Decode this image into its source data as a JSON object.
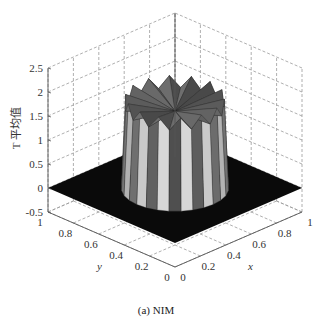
{
  "chart_data": {
    "type": "surface3d",
    "title": "",
    "caption": "(a) NIM",
    "xlabel": "x",
    "ylabel": "y",
    "zlabel": "T 平均值",
    "xlim": [
      0,
      1
    ],
    "ylim": [
      0,
      1
    ],
    "zlim": [
      -0.5,
      2.5
    ],
    "xticks": [
      "0",
      "0.2",
      "0.4",
      "0.6",
      "0.8",
      "1"
    ],
    "yticks": [
      "0",
      "0.2",
      "0.4",
      "0.6",
      "0.8",
      "1"
    ],
    "zticks": [
      "-0.5",
      "0",
      "0.5",
      "1",
      "1.5",
      "2",
      "2.5"
    ],
    "grid": true,
    "colormap": "gray",
    "surface": {
      "center": [
        0.5,
        0.5
      ],
      "radius": 0.3,
      "base_value": 0,
      "plateau_value": 1.65,
      "peak_value": 1.9
    }
  },
  "figure": {
    "caption_label": "(a) NIM"
  }
}
